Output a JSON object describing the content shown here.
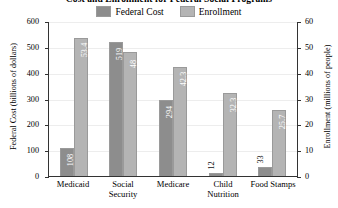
{
  "chart_data": {
    "type": "bar",
    "title": "Cost and Enrollment for Federal Social Programs",
    "categories": [
      "Medicaid",
      "Social Security",
      "Medicare",
      "Child Nutrition",
      "Food Stamps"
    ],
    "series": [
      {
        "name": "Federal Cost",
        "axis": "left",
        "color": "#8d8d8d",
        "values": [
          108,
          519,
          294,
          12,
          33
        ],
        "value_labels": [
          "108",
          "519",
          "294",
          "12",
          "33"
        ],
        "label_placement": [
          "inside",
          "inside",
          "inside",
          "outside",
          "outside"
        ]
      },
      {
        "name": "Enrollment",
        "axis": "right",
        "color": "#b4b4b4",
        "values": [
          53.4,
          48,
          42.3,
          32.3,
          25.7
        ],
        "value_labels": [
          "53.4",
          "48",
          "42.3",
          "32.3",
          "25.7"
        ],
        "label_placement": [
          "inside",
          "inside",
          "inside",
          "inside",
          "inside"
        ]
      }
    ],
    "xlabel": "",
    "ylabel": "Federal Cost (billions of dollars)",
    "y2label": "Enrollment (millions of people)",
    "ylim": [
      0,
      600
    ],
    "y2lim": [
      0,
      60
    ],
    "yticks": [
      "0",
      "100",
      "200",
      "300",
      "400",
      "500",
      "600"
    ],
    "y2ticks": [
      "0",
      "10",
      "20",
      "30",
      "40",
      "50",
      "60"
    ],
    "grid": true,
    "legend_position": "top-center"
  },
  "legend": {
    "items": [
      {
        "label": "Federal Cost",
        "swatch": "cost-swatch"
      },
      {
        "label": "Enrollment",
        "swatch": "enrollment-swatch"
      }
    ]
  },
  "axes": {
    "left_title": "Federal Cost (billions of dollars)",
    "right_title": "Enrollment (millions of people)"
  }
}
